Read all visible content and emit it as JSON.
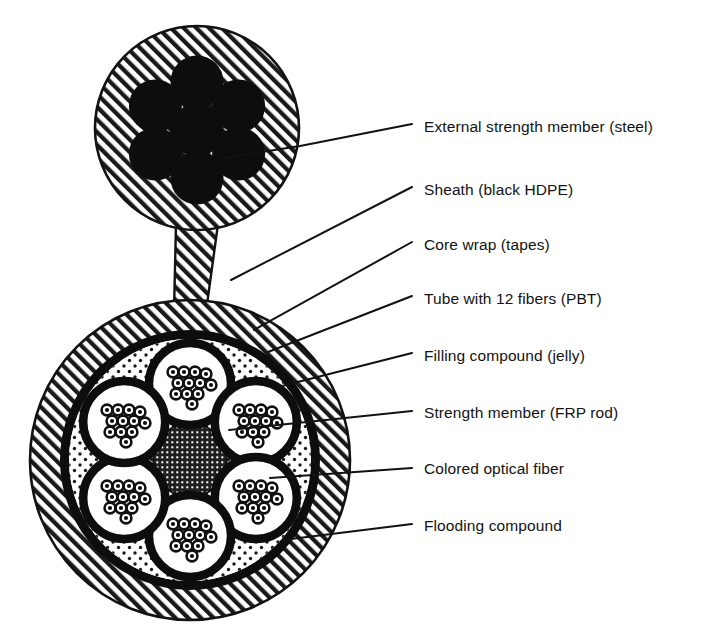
{
  "figure": {
    "background_color": "#ffffff",
    "ink_color": "#121212"
  },
  "colors": {
    "ink": "#121212",
    "hatch_line": "#1a1a1a",
    "hatch_background": "#ffffff",
    "steel_wire": "#0d0d0d",
    "core_wrap": "#0d0d0d",
    "tube_wall": "#0d0d0d",
    "filling_compound_dots": "#1a1a1a",
    "filling_compound_background": "#ffffff",
    "frp_rod": "#1f1f1f",
    "fiber_ring": "#111111",
    "fiber_core": "#0d0d0d",
    "leader_line": "#121212"
  },
  "upper_assembly": {
    "name": "external-strength-member-assembly",
    "sheath": {
      "center_x": 197,
      "center_y": 128,
      "radius": 102,
      "fill_pattern": "diagonal-hatch"
    },
    "steel_wire_count": 7,
    "steel_wire_radius": 26,
    "steel_wire_cluster_center_x": 197,
    "steel_wire_cluster_center_y": 130,
    "steel_wire_ring_radius": 48
  },
  "neck": {
    "name": "connecting-web",
    "top_y": 224,
    "bottom_y": 312,
    "top_half_width": 21,
    "bottom_half_width": 16,
    "fill_pattern": "diagonal-hatch"
  },
  "lower_assembly": {
    "name": "cable-core-assembly",
    "center_x": 190,
    "center_y": 460,
    "sheath_outer_radius": 160,
    "sheath_inner_radius": 130,
    "core_wrap_outer_radius": 130,
    "core_wrap_inner_radius": 121,
    "filling_compound_radius": 121,
    "frp_rod_radius": 37,
    "tube_count": 6,
    "tube_ring_radius": 76,
    "tube_outer_radius": 45,
    "tube_wall_thickness": 8,
    "fibers_per_tube": 12,
    "fiber_radius": 5.2
  },
  "callouts": [
    {
      "id": "external-strength-member",
      "label": "External strength member (steel)",
      "text_x": 424,
      "text_y": 128,
      "leader": [
        [
          225,
          158
        ],
        [
          300,
          146
        ],
        [
          412,
          124
        ]
      ]
    },
    {
      "id": "sheath",
      "label": "Sheath (black HDPE)",
      "text_x": 424,
      "text_y": 191,
      "leader": [
        [
          231,
          280
        ],
        [
          412,
          187
        ]
      ]
    },
    {
      "id": "core-wrap",
      "label": "Core wrap (tapes)",
      "text_x": 424,
      "text_y": 246,
      "leader": [
        [
          254,
          330
        ],
        [
          412,
          242
        ]
      ]
    },
    {
      "id": "tube-with-fibers",
      "label": "Tube with 12 fibers (PBT)",
      "text_x": 424,
      "text_y": 300,
      "leader": [
        [
          268,
          352
        ],
        [
          412,
          296
        ]
      ]
    },
    {
      "id": "filling-compound",
      "label": "Filling compound (jelly)",
      "text_x": 424,
      "text_y": 357,
      "leader": [
        [
          278,
          387
        ],
        [
          412,
          353
        ]
      ]
    },
    {
      "id": "strength-member",
      "label": "Strength member (FRP rod)",
      "text_x": 424,
      "text_y": 414,
      "leader": [
        [
          229,
          430
        ],
        [
          412,
          411
        ]
      ]
    },
    {
      "id": "colored-optical-fiber",
      "label": "Colored optical fiber",
      "text_x": 424,
      "text_y": 470,
      "leader": [
        [
          270,
          478
        ],
        [
          412,
          468
        ]
      ]
    },
    {
      "id": "flooding-compound",
      "label": "Flooding compound",
      "text_x": 424,
      "text_y": 527,
      "leader": [
        [
          283,
          540
        ],
        [
          412,
          524
        ]
      ]
    }
  ]
}
